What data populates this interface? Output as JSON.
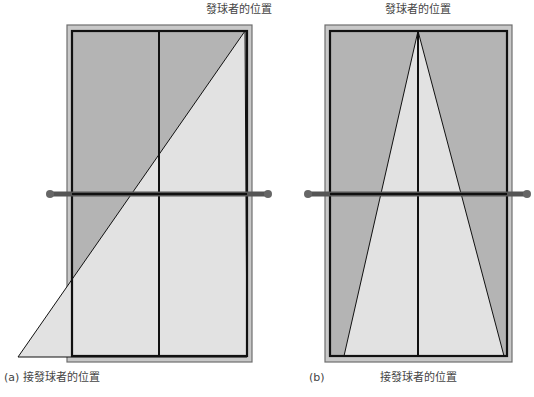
{
  "colors": {
    "court_dark": "#b4b4b4",
    "court_light": "#e2e2e2",
    "outer_border": "#c8c8c8",
    "outer_border_stroke": "#6e6e6e",
    "line": "#111111",
    "net": "#555555",
    "post": "#666666",
    "text": "#444444"
  },
  "panels": [
    {
      "id": "a",
      "caption_letter": "(a)",
      "server_label": "發球者的位置",
      "receiver_label": "接發球者的位置",
      "outer": {
        "x": 67,
        "y": 25,
        "w": 185,
        "h": 337
      },
      "inner": {
        "x": 72,
        "y": 31,
        "w": 175,
        "h": 325
      },
      "center_x": 159,
      "net_y": 194,
      "net_ends": [
        50,
        268
      ],
      "triangle": [
        [
          245,
          31
        ],
        [
          18,
          357
        ],
        [
          247,
          357
        ]
      ]
    },
    {
      "id": "b",
      "caption_letter": "(b)",
      "server_label": "發球者的位置",
      "receiver_label": "接發球者的位置",
      "outer": {
        "x": 325,
        "y": 25,
        "w": 187,
        "h": 337
      },
      "inner": {
        "x": 330,
        "y": 31,
        "w": 177,
        "h": 325
      },
      "center_x": 418,
      "net_y": 194,
      "net_ends": [
        308,
        527
      ],
      "triangle": [
        [
          418,
          31
        ],
        [
          344,
          356
        ],
        [
          504,
          356
        ]
      ]
    }
  ]
}
